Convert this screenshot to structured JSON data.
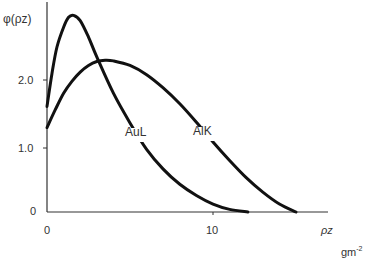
{
  "chart_data": {
    "type": "line",
    "title": "",
    "ylabel": "φ(ρz)",
    "xlabel": "ρz",
    "xunit": "gm",
    "xunit_exp": "-2",
    "xlim": [
      0,
      16
    ],
    "ylim": [
      0,
      3.0
    ],
    "x_ticks": [
      "0",
      "10"
    ],
    "y_ticks": [
      "0",
      "1.0",
      "2.0"
    ],
    "grid": false,
    "series": [
      {
        "name": "AuL",
        "label": "AuL",
        "x": [
          0,
          0.3,
          0.6,
          1.0,
          1.3,
          1.6,
          2.0,
          2.5,
          3.0,
          4.0,
          5.0,
          6.0,
          7.0,
          8.0,
          9.0,
          10.0,
          11.0,
          12.1
        ],
        "y": [
          1.6,
          2.1,
          2.5,
          2.8,
          2.95,
          2.98,
          2.9,
          2.65,
          2.35,
          1.8,
          1.35,
          0.95,
          0.65,
          0.42,
          0.25,
          0.12,
          0.04,
          0.0
        ]
      },
      {
        "name": "AlK",
        "label": "AlK",
        "x": [
          0,
          0.5,
          1.0,
          1.5,
          2.0,
          2.5,
          3.0,
          3.5,
          4.0,
          5.0,
          6.0,
          7.0,
          8.0,
          9.0,
          10.0,
          11.0,
          12.0,
          13.0,
          14.0,
          15.0
        ],
        "y": [
          1.28,
          1.55,
          1.8,
          1.98,
          2.12,
          2.22,
          2.28,
          2.3,
          2.29,
          2.22,
          2.08,
          1.88,
          1.64,
          1.36,
          1.06,
          0.78,
          0.52,
          0.3,
          0.12,
          0.0
        ]
      }
    ],
    "annotations": [
      {
        "text": "AuL",
        "x": 6.2,
        "y": 1.2
      },
      {
        "text": "AlK",
        "x": 9.0,
        "y": 1.2
      }
    ]
  },
  "labels": {
    "yaxis": "φ(ρz)",
    "xaxis": "ρz",
    "unit": "gm",
    "unit_exp": "-2",
    "y0": "0",
    "y1": "1.0",
    "y2": "2.0",
    "x0": "0",
    "x10": "10",
    "aul": "AuL",
    "alk": "AlK"
  }
}
